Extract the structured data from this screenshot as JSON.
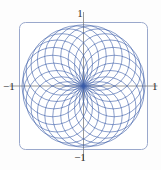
{
  "figure": {
    "background_color": "#fdfdfd",
    "frame": {
      "color": "#9aa8cc",
      "fill": "#ffffff",
      "x": 19,
      "y": 22,
      "width": 129,
      "height": 128,
      "corner_radius": 6
    },
    "axes": {
      "color": "#8c8c8c",
      "center_x": 83.5,
      "center_y": 86,
      "half_length": 74
    }
  },
  "labels": {
    "top": "1",
    "bottom": "−1",
    "left": "−1",
    "right": "1"
  },
  "chart_data": {
    "type": "line",
    "title": "",
    "xlabel": "",
    "ylabel": "",
    "xlim": [
      -1,
      1
    ],
    "ylim": [
      -1,
      1
    ],
    "xticks": [
      -1,
      1
    ],
    "yticks": [
      -1,
      1
    ],
    "xticklabels": [
      "−1",
      "1"
    ],
    "yticklabels": [
      "−1",
      "1"
    ],
    "grid": false,
    "legend": null,
    "curve_color": "#3a5ca8",
    "curve_width": 0.7,
    "series": [
      {
        "name": "circle-family",
        "count": 24,
        "circle_radius": 0.5,
        "center_locus_radius": 0.5,
        "angle_step_deg": 15,
        "center_angles_deg": [
          0,
          15,
          30,
          45,
          60,
          75,
          90,
          105,
          120,
          135,
          150,
          165,
          180,
          195,
          210,
          225,
          240,
          255,
          270,
          285,
          300,
          315,
          330,
          345
        ]
      }
    ]
  }
}
